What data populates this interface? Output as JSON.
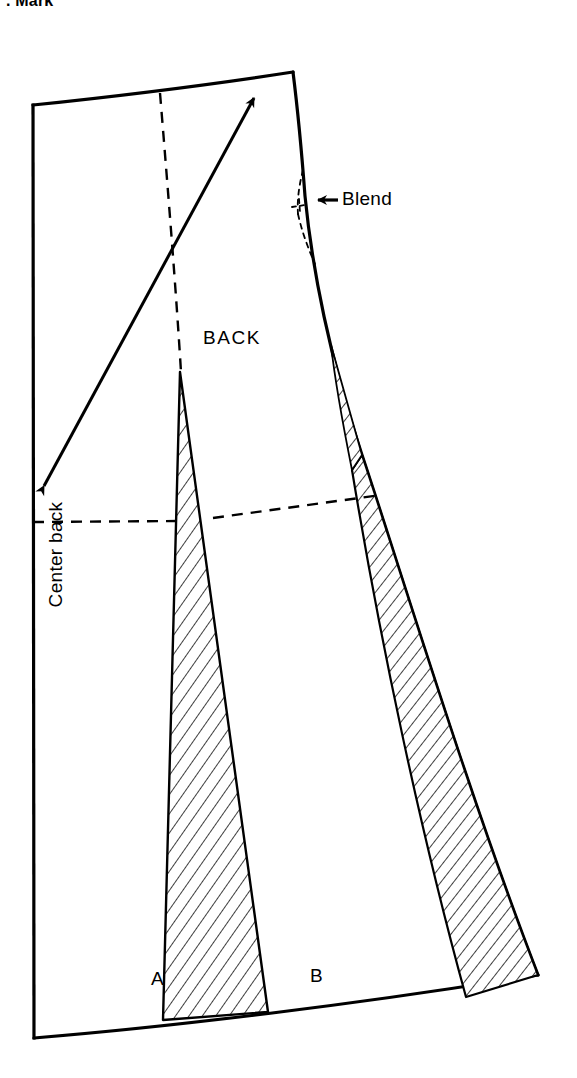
{
  "figure": {
    "clipped_caption": ". Mark",
    "piece_label": "BACK",
    "center_back_label": "Center back",
    "blend_label": "Blend",
    "dart_markers": [
      "A",
      "B"
    ],
    "line_color": "#000000",
    "background_color": "#ffffff",
    "hatch_color": "#000000"
  },
  "annotations": {
    "grainline_arrow": {
      "name": "grainline-double-arrow",
      "from_x": 40,
      "from_y": 492,
      "to_x": 258,
      "to_y": 92
    },
    "blend_pointer": {
      "name": "blend-arrow",
      "direction": "left",
      "x": 320,
      "y": 200
    }
  },
  "geometry": {
    "waist_left": [
      33,
      105
    ],
    "waist_right": [
      293,
      72
    ],
    "hem_left": [
      34,
      1038
    ],
    "hem_right": [
      538,
      975
    ],
    "hip_line_left_y": 522,
    "hip_line_right_y": 495,
    "dart_a_apex": [
      180,
      372
    ],
    "dart_a_hem": [
      163,
      1020
    ],
    "dart_b_apex": [
      362,
      345
    ],
    "dart_b_hem": [
      466,
      997
    ]
  }
}
